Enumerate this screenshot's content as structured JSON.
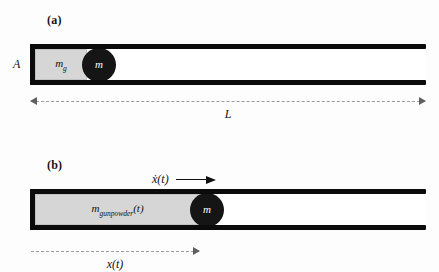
{
  "figure": {
    "background_color": "#fdfdfd",
    "wall_color": "#0b0b0b",
    "charge_color": "#d6d6d6",
    "projectile_color": "#151515",
    "dimension_color": "#9a9a9a"
  },
  "panel_a": {
    "label": "(a)",
    "area_label": "A",
    "charge_symbol": "m",
    "charge_subscript": "g",
    "projectile_label": "m",
    "dimension": {
      "caption": "L",
      "style": "double-arrow-dashed"
    }
  },
  "panel_b": {
    "label": "(b)",
    "charge_symbol": "m",
    "charge_subscript": "gunpowder",
    "charge_argument": "(t)",
    "projectile_label": "m",
    "velocity_label": "ẋ(t)",
    "velocity_arrow": "right-arrow-icon",
    "dimension": {
      "caption": "x(t)",
      "style": "single-arrow-dashed"
    }
  }
}
